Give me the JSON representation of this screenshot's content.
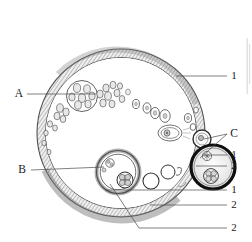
{
  "figure": {
    "background_color": "#ffffff",
    "ink_color": "#1a1a1a",
    "cortex_color": "#8a8a8a",
    "stroke_color": "#3a3a3a"
  },
  "labels": {
    "a": "A",
    "b": "B",
    "c": "C",
    "one_top": "1",
    "one_c": "1",
    "two_c": "2",
    "one_bottom": "1",
    "two_bottom": "2",
    "two_bottom2": "2"
  },
  "label_list": [
    {
      "text": "A",
      "x": 19,
      "y": 94,
      "anchor": "middle",
      "kind": "letter"
    },
    {
      "text": "B",
      "x": 22,
      "y": 170,
      "anchor": "middle",
      "kind": "letter"
    },
    {
      "text": "C",
      "x": 234,
      "y": 134,
      "anchor": "middle",
      "kind": "letter"
    },
    {
      "text": "1",
      "x": 234,
      "y": 76,
      "anchor": "middle",
      "kind": "number"
    },
    {
      "text": "1",
      "x": 234,
      "y": 155,
      "anchor": "middle",
      "kind": "number"
    },
    {
      "text": "2",
      "x": 234,
      "y": 166,
      "anchor": "middle",
      "kind": "number"
    },
    {
      "text": "1",
      "x": 234,
      "y": 190,
      "anchor": "middle",
      "kind": "number"
    },
    {
      "text": "2",
      "x": 234,
      "y": 205,
      "anchor": "middle",
      "kind": "number"
    },
    {
      "text": "2",
      "x": 234,
      "y": 228,
      "anchor": "middle",
      "kind": "number"
    }
  ],
  "leaders": [
    {
      "name": "leader-one-top",
      "d": "M227,76 L176,76"
    },
    {
      "name": "leader-a",
      "d": "M27,94 L96,94"
    },
    {
      "name": "leader-b",
      "d": "M31,170 L104,167"
    },
    {
      "name": "leader-c-upper",
      "d": "M227,134 L204,139"
    },
    {
      "name": "leader-c-lower",
      "d": "M227,134 L200,158"
    },
    {
      "name": "leader-one-c",
      "d": "M227,155 L203,155"
    },
    {
      "name": "leader-two-c",
      "d": "M227,166 L196,166"
    },
    {
      "name": "leader-one-bottom",
      "d": "M227,190 L106,190"
    },
    {
      "name": "leader-two-bottom",
      "d": "M227,205 L150,205"
    },
    {
      "name": "leader-two-bottom2",
      "d": "M227,228 L139,228"
    },
    {
      "name": "leader-cl-diagonal",
      "d": "M139,228 L110,184"
    }
  ],
  "structures": {
    "ovary_outline": {
      "cx": 121,
      "cy": 133,
      "r": 84
    },
    "cortex_band": {
      "inner_r": 76,
      "outer_r": 84
    },
    "primordial_cluster_A": {
      "cx": 82,
      "cy": 96,
      "r": 15
    },
    "corpus_luteum_B": {
      "cx": 118,
      "cy": 172,
      "r": 21
    },
    "corpus_luteum_C": {
      "cx": 213,
      "cy": 166,
      "r": 22
    },
    "small_follicle_C": {
      "cx": 202,
      "cy": 138,
      "r": 9
    },
    "growing_follicles": [
      {
        "cx": 109,
        "cy": 104,
        "rx": 3.5,
        "ry": 4.5
      },
      {
        "cx": 119,
        "cy": 101,
        "rx": 4,
        "ry": 5
      },
      {
        "cx": 128,
        "cy": 108,
        "rx": 4,
        "ry": 5
      },
      {
        "cx": 138,
        "cy": 113,
        "rx": 4.5,
        "ry": 5.5
      },
      {
        "cx": 150,
        "cy": 110,
        "rx": 4,
        "ry": 5
      },
      {
        "cx": 158,
        "cy": 116,
        "rx": 5,
        "ry": 6
      },
      {
        "cx": 170,
        "cy": 130,
        "rx": 11,
        "ry": 7.5
      },
      {
        "cx": 192,
        "cy": 126,
        "rx": 4,
        "ry": 4.5
      }
    ],
    "antral_vesicles": [
      {
        "cx": 152,
        "cy": 180,
        "r": 8
      },
      {
        "cx": 166,
        "cy": 173,
        "r": 7
      }
    ]
  },
  "legend_meaning": {
    "A": "cluster of primordial / primary follicles",
    "B": "corpus luteum (central)",
    "C": "corpus luteum / regressing follicle (peripheral)",
    "1": "granulosa / theca layer",
    "2": "connective tissue stroma"
  }
}
